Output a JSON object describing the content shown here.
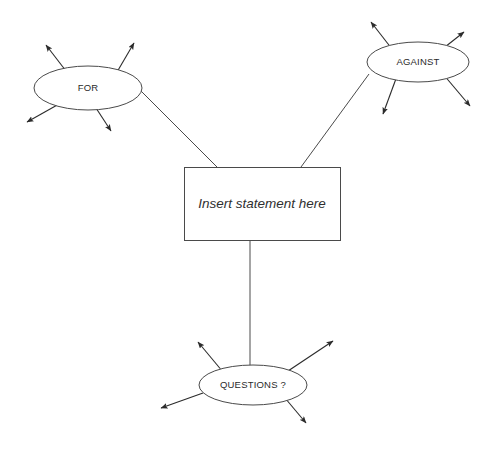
{
  "diagram": {
    "background_color": "#ffffff",
    "line_color": "#4a4a4a",
    "arrow_color": "#2b2b2b",
    "text_color": "#2f2f2f",
    "center": {
      "shape": "rectangle",
      "label": "Insert statement here",
      "italic": true,
      "x": 184,
      "y": 167,
      "width": 156,
      "height": 73
    },
    "nodes": [
      {
        "id": "for",
        "shape": "ellipse",
        "label": "FOR",
        "cx": 88,
        "cy": 88,
        "rx": 54,
        "ry": 22,
        "spokes": [
          {
            "name": "for-spoke-upper-left",
            "x1": 66,
            "y1": 71,
            "x2": 46,
            "y2": 45
          },
          {
            "name": "for-spoke-upper-right",
            "x1": 117,
            "y1": 72,
            "x2": 134,
            "y2": 43
          },
          {
            "name": "for-spoke-lower-left",
            "x1": 59,
            "y1": 104,
            "x2": 27,
            "y2": 122
          },
          {
            "name": "for-spoke-lower-right",
            "x1": 96,
            "y1": 108,
            "x2": 111,
            "y2": 131
          }
        ]
      },
      {
        "id": "against",
        "shape": "ellipse",
        "label": "AGAINST",
        "cx": 418,
        "cy": 62,
        "rx": 51,
        "ry": 20,
        "spokes": [
          {
            "name": "against-spoke-upper-left",
            "x1": 392,
            "y1": 49,
            "x2": 371,
            "y2": 22
          },
          {
            "name": "against-spoke-upper-right",
            "x1": 445,
            "y1": 47,
            "x2": 464,
            "y2": 32
          },
          {
            "name": "against-spoke-lower-left",
            "x1": 397,
            "y1": 76,
            "x2": 383,
            "y2": 114
          },
          {
            "name": "against-spoke-lower-right",
            "x1": 443,
            "y1": 74,
            "x2": 470,
            "y2": 106
          }
        ]
      },
      {
        "id": "questions",
        "shape": "ellipse",
        "label": "QUESTIONS ?",
        "cx": 253,
        "cy": 385,
        "rx": 54,
        "ry": 20,
        "spokes": [
          {
            "name": "questions-spoke-upper-left",
            "x1": 223,
            "y1": 372,
            "x2": 198,
            "y2": 342
          },
          {
            "name": "questions-spoke-upper-right",
            "x1": 288,
            "y1": 371,
            "x2": 333,
            "y2": 341
          },
          {
            "name": "questions-spoke-left",
            "x1": 203,
            "y1": 393,
            "x2": 161,
            "y2": 408
          },
          {
            "name": "questions-spoke-lower-right",
            "x1": 285,
            "y1": 398,
            "x2": 306,
            "y2": 423
          }
        ]
      }
    ],
    "connectors": [
      {
        "name": "connector-for-to-statement",
        "from": "for",
        "to": "center",
        "x1": 141,
        "y1": 91,
        "x2": 217,
        "y2": 167
      },
      {
        "name": "connector-against-to-statement",
        "from": "against",
        "to": "center",
        "x1": 369,
        "y1": 74,
        "x2": 301,
        "y2": 167
      },
      {
        "name": "connector-statement-to-questions",
        "from": "center",
        "to": "questions",
        "x1": 250,
        "y1": 240,
        "x2": 250,
        "y2": 366
      }
    ]
  }
}
